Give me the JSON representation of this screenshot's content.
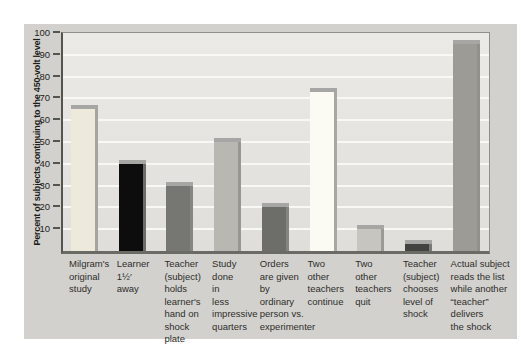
{
  "figure": {
    "page_background": "#ffffff",
    "panel_background": "#d2d1ce"
  },
  "chart_data": {
    "type": "bar",
    "title": "",
    "ylabel": "Percent of subjects continuing to the 450-volt level",
    "xlabel": "",
    "ylim": [
      0,
      100
    ],
    "yticks": [
      100,
      90,
      80,
      70,
      60,
      50,
      40,
      30,
      20,
      10
    ],
    "grid": "horizontal white gridlines every 10",
    "legend": "none",
    "categories": [
      "Milgram's original study",
      "Learner 1½′ away",
      "Teacher (subject) holds learner's hand on shock plate",
      "Study done in less impressive quarters",
      "Orders are given by ordinary person vs. experimenter",
      "Two other teachers continue",
      "Two other teachers quit",
      "Teacher (subject) chooses level of shock",
      "Actual subject reads the list while another “teacher” delivers the shock"
    ],
    "categories_wrapped": [
      [
        "Milgram's",
        "original",
        "study"
      ],
      [
        "Learner",
        "1½′",
        "away"
      ],
      [
        "Teacher",
        "(subject)",
        "holds",
        "learner's",
        "hand on",
        "shock",
        "plate"
      ],
      [
        "Study",
        "done",
        "in",
        "less",
        "impressive",
        "quarters"
      ],
      [
        "Orders",
        "are given",
        "by",
        "ordinary",
        "person vs.",
        "experimenter"
      ],
      [
        "Two",
        "other",
        "teachers",
        "continue"
      ],
      [
        "Two",
        "other",
        "teachers",
        "quit"
      ],
      [
        "Teacher",
        "(subject)",
        "chooses",
        "level of",
        "shock"
      ],
      [
        "Actual subject",
        "reads the list",
        "while another",
        "“teacher”",
        "delivers",
        "the shock"
      ]
    ],
    "values": [
      65,
      40,
      30,
      50,
      20,
      73,
      10,
      3,
      95
    ],
    "bar_colors": [
      "#edeadb",
      "#0d0d0d",
      "#767672",
      "#b8b7b2",
      "#6d6d69",
      "#fbfaf3",
      "#c6c5c0",
      "#424240",
      "#9c9b96"
    ],
    "bar_cap_color": "#a6a6a4",
    "plot_background": "#e6e5e2",
    "gridline_color": "#f8f8f5",
    "axis_color": "#55554f",
    "tick_label_color": "#252520",
    "category_label_color": "#2f2e2a"
  }
}
